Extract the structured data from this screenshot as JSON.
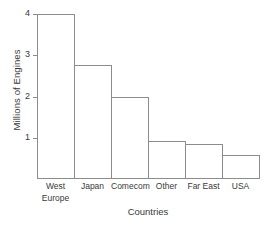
{
  "chart_data": {
    "type": "bar",
    "title": "",
    "subtitle": "",
    "xlabel": "Countries",
    "ylabel": "Millions of Engines",
    "categories": [
      "West\nEurope",
      "Japan",
      "Comecom",
      "Other",
      "Far East",
      "USA"
    ],
    "category_labels_flat": [
      "West Europe",
      "Japan",
      "Comecom",
      "Other",
      "Far East",
      "USA"
    ],
    "values": [
      4.0,
      2.77,
      1.98,
      0.93,
      0.84,
      0.58
    ],
    "ylim": [
      0,
      4.0
    ],
    "yticks": [
      1,
      2,
      3,
      4
    ],
    "ytick_labels": [
      "1",
      "2",
      "3",
      "4"
    ],
    "grid": false,
    "legend": null,
    "bar_fill_color": "#ffffff",
    "bar_edge_color": "#8c8c8c",
    "axis_color": "#8c8c8c",
    "text_color": "#3a3a3a",
    "background_color": "#ffffff"
  }
}
